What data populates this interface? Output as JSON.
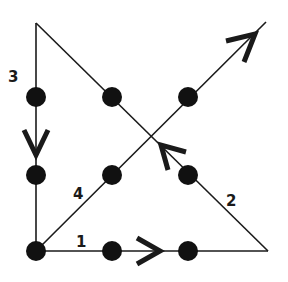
{
  "diagram": {
    "colors": {
      "line": "#1a1a1a",
      "dot": "#111111",
      "background": "#ffffff"
    },
    "dots": [
      {
        "row": 0,
        "col": 0,
        "x": 36,
        "y": 97
      },
      {
        "row": 0,
        "col": 1,
        "x": 112,
        "y": 97
      },
      {
        "row": 0,
        "col": 2,
        "x": 188,
        "y": 97
      },
      {
        "row": 1,
        "col": 0,
        "x": 36,
        "y": 175
      },
      {
        "row": 1,
        "col": 1,
        "x": 112,
        "y": 175
      },
      {
        "row": 1,
        "col": 2,
        "x": 188,
        "y": 175
      },
      {
        "row": 2,
        "col": 0,
        "x": 36,
        "y": 251
      },
      {
        "row": 2,
        "col": 1,
        "x": 112,
        "y": 251
      },
      {
        "row": 2,
        "col": 2,
        "x": 188,
        "y": 251
      }
    ],
    "path_points": [
      {
        "x": 36,
        "y": 251
      },
      {
        "x": 268,
        "y": 251
      },
      {
        "x": 36,
        "y": 23
      },
      {
        "x": 36,
        "y": 251
      },
      {
        "x": 266,
        "y": 22
      }
    ],
    "steps": [
      {
        "label": "1",
        "direction": "right",
        "label_x": 80,
        "label_y": 247
      },
      {
        "label": "2",
        "direction": "up-left",
        "label_x": 228,
        "label_y": 206
      },
      {
        "label": "3",
        "direction": "down",
        "label_x": 10,
        "label_y": 82
      },
      {
        "label": "4",
        "direction": "up-right",
        "label_x": 74,
        "label_y": 200
      }
    ]
  }
}
